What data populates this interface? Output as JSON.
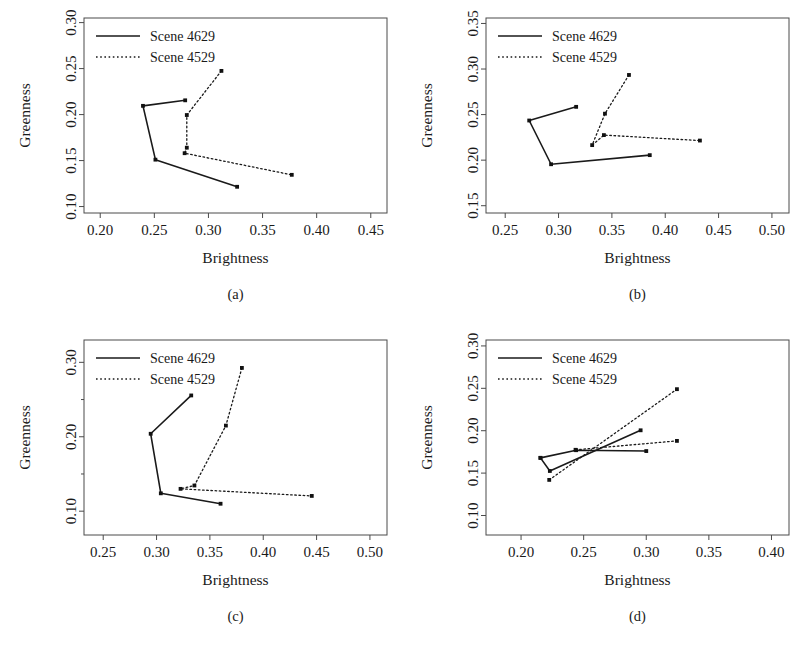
{
  "figure": {
    "title": "",
    "panel_count": 4
  },
  "legend": {
    "entries": [
      {
        "label": "Scene 4629",
        "style": "solid"
      },
      {
        "label": "Scene 4529",
        "style": "dotted"
      }
    ]
  },
  "axis_titles": {
    "x": "Brightness",
    "y": "Greenness"
  },
  "captions": {
    "a": "(a)",
    "b": "(b)",
    "c": "(c)",
    "d": "(d)"
  },
  "chart_data": [
    {
      "id": "a",
      "type": "line",
      "title": "(a)",
      "xlabel": "Brightness",
      "ylabel": "Greenness",
      "xlim": [
        0.185,
        0.465
      ],
      "ylim": [
        0.093,
        0.305
      ],
      "xticks": [
        0.2,
        0.25,
        0.3,
        0.35,
        0.4,
        0.45
      ],
      "xtick_labels": [
        "0.20",
        "0.25",
        "0.30",
        "0.35",
        "0.40",
        "0.45"
      ],
      "yticks": [
        0.1,
        0.15,
        0.2,
        0.25,
        0.3
      ],
      "ytick_labels": [
        "0.10",
        "0.15",
        "0.20",
        "0.25",
        "0.30"
      ],
      "grid": false,
      "legend_position": "top-left",
      "series": [
        {
          "name": "Scene 4629",
          "style": "solid",
          "points": [
            [
              0.2785,
              0.2155
            ],
            [
              0.2395,
              0.2095
            ],
            [
              0.251,
              0.151
            ],
            [
              0.3265,
              0.1215
            ]
          ]
        },
        {
          "name": "Scene 4529",
          "style": "dotted",
          "points": [
            [
              0.312,
              0.2475
            ],
            [
              0.28,
              0.1995
            ],
            [
              0.28,
              0.164
            ],
            [
              0.278,
              0.158
            ],
            [
              0.377,
              0.1345
            ]
          ]
        }
      ]
    },
    {
      "id": "b",
      "type": "line",
      "title": "(b)",
      "xlabel": "Brightness",
      "ylabel": "Greenness",
      "xlim": [
        0.232,
        0.516
      ],
      "ylim": [
        0.142,
        0.356
      ],
      "xticks": [
        0.25,
        0.3,
        0.35,
        0.4,
        0.45,
        0.5
      ],
      "xtick_labels": [
        "0.25",
        "0.30",
        "0.35",
        "0.40",
        "0.45",
        "0.50"
      ],
      "yticks": [
        0.15,
        0.2,
        0.25,
        0.3,
        0.35
      ],
      "ytick_labels": [
        "0.15",
        "0.20",
        "0.25",
        "0.30",
        "0.35"
      ],
      "grid": false,
      "legend_position": "top-left",
      "series": [
        {
          "name": "Scene 4629",
          "style": "solid",
          "points": [
            [
              0.3165,
              0.2585
            ],
            [
              0.2725,
              0.2435
            ],
            [
              0.293,
              0.1955
            ],
            [
              0.3855,
              0.2055
            ]
          ]
        },
        {
          "name": "Scene 4529",
          "style": "dotted",
          "points": [
            [
              0.366,
              0.2935
            ],
            [
              0.3435,
              0.251
            ],
            [
              0.3315,
              0.2165
            ],
            [
              0.3425,
              0.2275
            ],
            [
              0.4325,
              0.2215
            ]
          ]
        }
      ]
    },
    {
      "id": "c",
      "type": "line",
      "title": "(c)",
      "xlabel": "Brightness",
      "ylabel": "Greenness",
      "xlim": [
        0.232,
        0.516
      ],
      "ylim": [
        0.068,
        0.33
      ],
      "xticks": [
        0.25,
        0.3,
        0.35,
        0.4,
        0.45,
        0.5
      ],
      "xtick_labels": [
        "0.25",
        "0.30",
        "0.35",
        "0.40",
        "0.45",
        "0.50"
      ],
      "yticks": [
        0.1,
        0.2,
        0.3
      ],
      "ytick_labels": [
        "0.10",
        "0.20",
        "0.30"
      ],
      "yticks_minor": [
        0.15,
        0.25
      ],
      "grid": false,
      "legend_position": "top-left",
      "series": [
        {
          "name": "Scene 4629",
          "style": "solid",
          "points": [
            [
              0.3325,
              0.2555
            ],
            [
              0.2945,
              0.204
            ],
            [
              0.304,
              0.124
            ],
            [
              0.36,
              0.11
            ]
          ]
        },
        {
          "name": "Scene 4529",
          "style": "dotted",
          "points": [
            [
              0.38,
              0.2925
            ],
            [
              0.365,
              0.215
            ],
            [
              0.3355,
              0.1345
            ],
            [
              0.3225,
              0.13
            ],
            [
              0.4455,
              0.1205
            ]
          ]
        }
      ]
    },
    {
      "id": "d",
      "type": "line",
      "title": "(d)",
      "xlabel": "Brightness",
      "ylabel": "Greenness",
      "xlim": [
        0.172,
        0.414
      ],
      "ylim": [
        0.077,
        0.307
      ],
      "xticks": [
        0.2,
        0.25,
        0.3,
        0.35,
        0.4
      ],
      "xtick_labels": [
        "0.20",
        "0.25",
        "0.30",
        "0.35",
        "0.40"
      ],
      "yticks": [
        0.1,
        0.15,
        0.2,
        0.25,
        0.3
      ],
      "ytick_labels": [
        "0.10",
        "0.15",
        "0.20",
        "0.25",
        "0.30"
      ],
      "grid": false,
      "legend_position": "top-left",
      "series": [
        {
          "name": "Scene 4629",
          "style": "solid",
          "points": [
            [
              0.2155,
              0.168
            ],
            [
              0.223,
              0.1525
            ],
            [
              0.2955,
              0.2005
            ]
          ]
        },
        {
          "name": "Scene 4629 b",
          "style": "solid",
          "points": [
            [
              0.2155,
              0.168
            ],
            [
              0.244,
              0.177
            ],
            [
              0.3,
              0.176
            ]
          ]
        },
        {
          "name": "Scene 4529",
          "style": "dotted",
          "points": [
            [
              0.2225,
              0.142
            ],
            [
              0.3245,
              0.249
            ]
          ]
        },
        {
          "name": "Scene 4529 b",
          "style": "dotted",
          "points": [
            [
              0.2435,
              0.1775
            ],
            [
              0.3245,
              0.188
            ]
          ]
        }
      ]
    }
  ]
}
